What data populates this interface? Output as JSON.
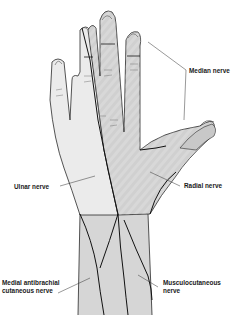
{
  "figure": {
    "colors": {
      "background": "#ffffff",
      "outline": "#2a2a2a",
      "nerve_line": "#111111",
      "region_light": "#e9e9e9",
      "region_mid": "#d2d2d2",
      "region_dark": "#c4c4c4",
      "label_text": "#1a1a1a"
    }
  },
  "labels": {
    "median": "Median nerve",
    "ulnar": "Ulnar nerve",
    "radial": "Radial nerve",
    "medial_antibrachial_line1": "Medial antibrachial",
    "medial_antibrachial_line2": "cutaneous nerve",
    "musculocutaneous_line1": "Musculocutaneous",
    "musculocutaneous_line2": "nerve"
  }
}
